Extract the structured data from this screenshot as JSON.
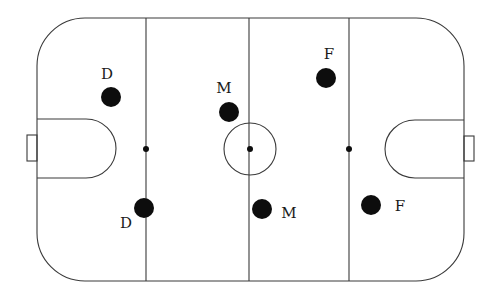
{
  "diagram": {
    "rink": {
      "x": 37,
      "y": 18,
      "width": 427,
      "height": 263,
      "corner_radius": 48,
      "stroke_color": "#3a3a3a",
      "lines_x": [
        146,
        249,
        349
      ],
      "center_circle": {
        "cx": 250,
        "cy": 149,
        "r": 26
      },
      "face_dots": [
        {
          "cx": 146,
          "cy": 149
        },
        {
          "cx": 250,
          "cy": 149
        },
        {
          "cx": 349,
          "cy": 149
        }
      ]
    },
    "players": [
      {
        "role": "D",
        "label": "D",
        "dot": {
          "cx": 111,
          "cy": 97
        },
        "label_pos": {
          "x": 107,
          "y": 75
        }
      },
      {
        "role": "M",
        "label": "M",
        "dot": {
          "cx": 229,
          "cy": 112
        },
        "label_pos": {
          "x": 224,
          "y": 89
        }
      },
      {
        "role": "F",
        "label": "F",
        "dot": {
          "cx": 326,
          "cy": 78
        },
        "label_pos": {
          "x": 329,
          "y": 55
        }
      },
      {
        "role": "D",
        "label": "D",
        "dot": {
          "cx": 144,
          "cy": 208
        },
        "label_pos": {
          "x": 126,
          "y": 224
        }
      },
      {
        "role": "M",
        "label": "M",
        "dot": {
          "cx": 262,
          "cy": 209
        },
        "label_pos": {
          "x": 289,
          "y": 214
        }
      },
      {
        "role": "F",
        "label": "F",
        "dot": {
          "cx": 371,
          "cy": 205
        },
        "label_pos": {
          "x": 400,
          "y": 207
        }
      }
    ],
    "player_color": "#0d0d0d",
    "player_radius": 10
  }
}
